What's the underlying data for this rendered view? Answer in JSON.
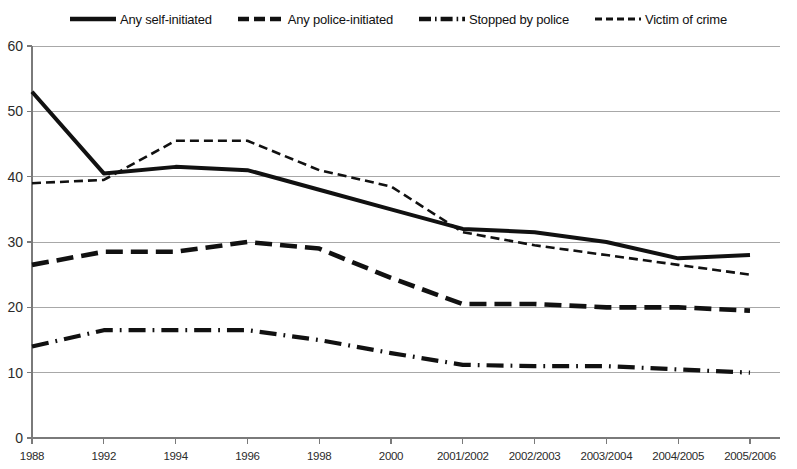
{
  "legend": {
    "position": "top-center",
    "entries": [
      {
        "label": "Any self-initiated",
        "style": "solid",
        "icon": "solid-line-icon"
      },
      {
        "label": "Any police-initiated",
        "style": "dashed",
        "icon": "dashed-line-icon"
      },
      {
        "label": "Stopped by police",
        "style": "dash-dot",
        "icon": "dash-dot-line-icon"
      },
      {
        "label": "Victim of crime",
        "style": "fine-dashed",
        "icon": "fine-dashed-line-icon"
      }
    ]
  },
  "axes": {
    "y_ticks": [
      "0",
      "10",
      "20",
      "30",
      "40",
      "50",
      "60"
    ],
    "x_ticks": [
      "1988",
      "1992",
      "1994",
      "1996",
      "1998",
      "2000",
      "2001/2002",
      "2002/2003",
      "2003/2004",
      "2004/2005",
      "2005/2006"
    ]
  },
  "colors": {
    "series": "#111111",
    "grid": "#a8a8a8",
    "axis": "#7a7a7a",
    "background": "#ffffff",
    "text": "#2b2b2b"
  },
  "chart_data": {
    "type": "line",
    "title": "",
    "subtitle": "",
    "xlabel": "",
    "ylabel": "",
    "xlim": null,
    "ylim": [
      0,
      60
    ],
    "yticks": [
      0,
      10,
      20,
      30,
      40,
      50,
      60
    ],
    "grid": true,
    "legend_position": "top-center",
    "categories": [
      "1988",
      "1992",
      "1994",
      "1996",
      "1998",
      "2000",
      "2001/2002",
      "2002/2003",
      "2003/2004",
      "2004/2005",
      "2005/2006"
    ],
    "series": [
      {
        "name": "Any self-initiated",
        "style": "solid",
        "values": [
          53,
          40.5,
          41.5,
          41,
          38,
          35,
          32,
          31.5,
          30,
          27.5,
          28
        ]
      },
      {
        "name": "Any police-initiated",
        "style": "dashed",
        "values": [
          26.5,
          28.5,
          28.5,
          30,
          29,
          24.5,
          20.5,
          20.5,
          20,
          20,
          19.5
        ]
      },
      {
        "name": "Stopped by police",
        "style": "dash-dot",
        "values": [
          14,
          16.5,
          16.5,
          16.5,
          15,
          13,
          11.2,
          11,
          11,
          10.5,
          10
        ]
      },
      {
        "name": "Victim of crime",
        "style": "fine-dashed",
        "values": [
          39,
          39.5,
          45.5,
          45.5,
          41,
          38.5,
          31.5,
          29.5,
          28,
          26.5,
          25
        ]
      }
    ]
  }
}
